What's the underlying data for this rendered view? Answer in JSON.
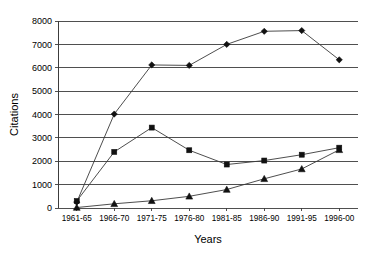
{
  "chart_data": {
    "type": "line",
    "title": "",
    "xlabel": "Years",
    "ylabel": "Citations",
    "categories": [
      "1961-65",
      "1966-70",
      "1971-75",
      "1976-80",
      "1981-85",
      "1986-90",
      "1991-95",
      "1996-00"
    ],
    "ylim": [
      0,
      8000
    ],
    "ytick_labels": [
      "0",
      "1000",
      "2000",
      "3000",
      "4000",
      "5000",
      "6000",
      "7000",
      "8000"
    ],
    "ytick_values": [
      0,
      1000,
      2000,
      3000,
      4000,
      5000,
      6000,
      7000,
      8000
    ],
    "grid": true,
    "legend": "none",
    "series": [
      {
        "name": "diamond-series",
        "marker": "diamond",
        "values": [
          250,
          4020,
          6120,
          6100,
          7000,
          7560,
          7590,
          6340
        ]
      },
      {
        "name": "square-series",
        "marker": "square",
        "values": [
          300,
          2400,
          3440,
          2470,
          1860,
          2030,
          2280,
          2580
        ]
      },
      {
        "name": "triangle-series",
        "marker": "triangle",
        "values": [
          20,
          180,
          310,
          500,
          790,
          1250,
          1670,
          2490
        ]
      }
    ]
  }
}
